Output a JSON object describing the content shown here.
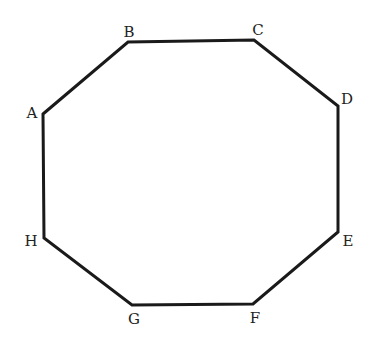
{
  "diagram": {
    "type": "octagon",
    "stroke_color": "#1a1a1a",
    "stroke_width": 3,
    "vertices": [
      {
        "label": "A",
        "x": 43,
        "y": 114,
        "lx": 32,
        "ly": 113
      },
      {
        "label": "B",
        "x": 128,
        "y": 42,
        "lx": 129,
        "ly": 32
      },
      {
        "label": "C",
        "x": 254,
        "y": 40,
        "lx": 258,
        "ly": 30
      },
      {
        "label": "D",
        "x": 338,
        "y": 106,
        "lx": 347,
        "ly": 99
      },
      {
        "label": "E",
        "x": 338,
        "y": 232,
        "lx": 348,
        "ly": 241
      },
      {
        "label": "F",
        "x": 253,
        "y": 304,
        "lx": 255,
        "ly": 318
      },
      {
        "label": "G",
        "x": 132,
        "y": 305,
        "lx": 134,
        "ly": 319
      },
      {
        "label": "H",
        "x": 44,
        "y": 238,
        "lx": 31,
        "ly": 241
      }
    ]
  },
  "labels": {
    "A": "A",
    "B": "B",
    "C": "C",
    "D": "D",
    "E": "E",
    "F": "F",
    "G": "G",
    "H": "H"
  }
}
